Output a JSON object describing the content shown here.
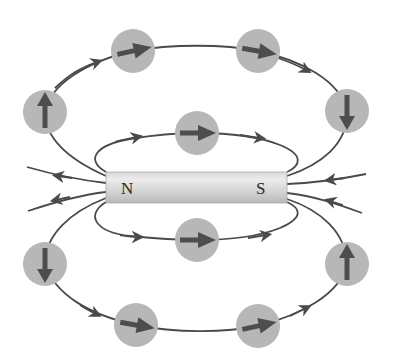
{
  "diagram": {
    "magnet": {
      "north_label": "N",
      "south_label": "S",
      "x": 106,
      "y": 172,
      "width": 181,
      "height": 31
    },
    "colors": {
      "field_line": "#4a4a4a",
      "compass_body": "#b7b7b7",
      "needle": "#4d4d4d",
      "magnet_light": "#e8e8e8",
      "magnet_dark": "#bdbdbd"
    },
    "compasses": [
      {
        "id": "outer-top-left",
        "cx": 45,
        "cy": 112,
        "direction": "up"
      },
      {
        "id": "outer-top-mid-left",
        "cx": 133,
        "cy": 51,
        "direction": "right"
      },
      {
        "id": "outer-top-mid-right",
        "cx": 258,
        "cy": 51,
        "direction": "right"
      },
      {
        "id": "outer-top-right",
        "cx": 347,
        "cy": 111,
        "direction": "down"
      },
      {
        "id": "inner-top",
        "cx": 197,
        "cy": 133,
        "direction": "right"
      },
      {
        "id": "inner-bottom",
        "cx": 197,
        "cy": 240,
        "direction": "right"
      },
      {
        "id": "outer-bottom-left",
        "cx": 45,
        "cy": 264,
        "direction": "down"
      },
      {
        "id": "outer-bottom-mid-left",
        "cx": 136,
        "cy": 325,
        "direction": "right"
      },
      {
        "id": "outer-bottom-mid-right",
        "cx": 258,
        "cy": 326,
        "direction": "right"
      },
      {
        "id": "outer-bottom-right",
        "cx": 347,
        "cy": 264,
        "direction": "up"
      }
    ]
  }
}
